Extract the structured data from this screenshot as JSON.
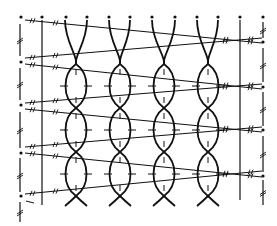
{
  "diagram": {
    "type": "twined-cord-weave",
    "colors": {
      "ink": "#111111",
      "background": "#ffffff"
    },
    "stroke_width": {
      "cord": 1.8,
      "thread": 1.0,
      "frame": 1.2,
      "tick": 1.0
    },
    "frame": {
      "left_dashed_x": 20,
      "left_solid_x": 42,
      "right_solid_x": 240,
      "right_dashed_x": 263,
      "top_y": 20,
      "bottom_left_y": 205,
      "bottom_right_y": 200
    },
    "top_dots_x": [
      21,
      42,
      66,
      87,
      109,
      130,
      152,
      175,
      197,
      218,
      240,
      263
    ],
    "top_dots_y": 17,
    "side_dots": {
      "left": [
        [
          21,
          62
        ],
        [
          21,
          105
        ],
        [
          21,
          153
        ],
        [
          21,
          196
        ]
      ],
      "right": [
        [
          263,
          42
        ],
        [
          263,
          87
        ],
        [
          263,
          130
        ],
        [
          263,
          176
        ]
      ]
    },
    "cords": [
      {
        "cx": 76,
        "left_top_x": 65,
        "right_top_x": 87
      },
      {
        "cx": 120,
        "left_top_x": 109,
        "right_top_x": 130
      },
      {
        "cx": 164,
        "left_top_x": 152,
        "right_top_x": 175
      },
      {
        "cx": 208,
        "left_top_x": 197,
        "right_top_x": 218
      }
    ],
    "cord_top_y": 20,
    "cord_crossings_y": [
      64,
      108,
      152,
      196
    ],
    "cord_half_width": 12,
    "cord_bottom_y": 206,
    "threads": [
      {
        "x1": 25,
        "y1": 20,
        "x2": 262,
        "y2": 43
      },
      {
        "x1": 25,
        "y1": 58,
        "x2": 262,
        "y2": 38
      },
      {
        "x1": 25,
        "y1": 64,
        "x2": 262,
        "y2": 89
      },
      {
        "x1": 25,
        "y1": 103,
        "x2": 262,
        "y2": 84
      },
      {
        "x1": 25,
        "y1": 109,
        "x2": 262,
        "y2": 132
      },
      {
        "x1": 25,
        "y1": 147,
        "x2": 262,
        "y2": 127
      },
      {
        "x1": 25,
        "y1": 153,
        "x2": 262,
        "y2": 177
      },
      {
        "x1": 25,
        "y1": 194,
        "x2": 262,
        "y2": 171
      }
    ],
    "left_dashed_segments": [
      [
        24,
        56
      ],
      [
        68,
        100
      ],
      [
        112,
        148
      ],
      [
        158,
        192
      ],
      [
        202,
        222
      ]
    ],
    "right_dashed_segments": [
      [
        22,
        38
      ],
      [
        48,
        82
      ],
      [
        92,
        126
      ],
      [
        136,
        172
      ],
      [
        180,
        205
      ]
    ]
  }
}
